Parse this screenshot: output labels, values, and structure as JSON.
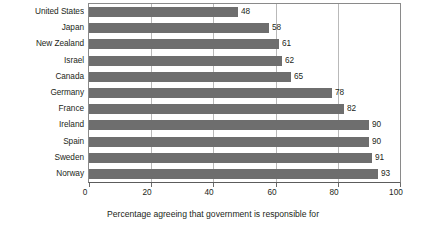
{
  "chart_data": {
    "type": "bar",
    "orientation": "horizontal",
    "title": "",
    "subtitle": "",
    "caption": "Percentage agreeing that government is responsible for",
    "xlabel": "",
    "ylabel": "",
    "xlim": [
      0,
      100
    ],
    "xticks": [
      "0",
      "20",
      "40",
      "60",
      "80",
      "100"
    ],
    "xtick_values": [
      0,
      20,
      40,
      60,
      80,
      100
    ],
    "grid": "vertical",
    "legend": "none",
    "bar_color": "#6e6e6e",
    "axis_color": "#8a8a8a",
    "grid_color": "#b9b9b9",
    "text_color": "#231f20",
    "categories": [
      "United States",
      "Japan",
      "New Zealand",
      "Israel",
      "Canada",
      "Germany",
      "France",
      "Ireland",
      "Spain",
      "Sweden",
      "Norway"
    ],
    "values": [
      48,
      58,
      61,
      62,
      65,
      78,
      82,
      90,
      90,
      91,
      93
    ],
    "value_labels": [
      "48",
      "58",
      "61",
      "62",
      "65",
      "78",
      "82",
      "90",
      "90",
      "91",
      "93"
    ],
    "rows": [
      {
        "label": "United States",
        "value": 48,
        "value_label": "48"
      },
      {
        "label": "Japan",
        "value": 58,
        "value_label": "58"
      },
      {
        "label": "New Zealand",
        "value": 61,
        "value_label": "61"
      },
      {
        "label": "Israel",
        "value": 62,
        "value_label": "62"
      },
      {
        "label": "Canada",
        "value": 65,
        "value_label": "65"
      },
      {
        "label": "Germany",
        "value": 78,
        "value_label": "78"
      },
      {
        "label": "France",
        "value": 82,
        "value_label": "82"
      },
      {
        "label": "Ireland",
        "value": 90,
        "value_label": "90"
      },
      {
        "label": "Spain",
        "value": 90,
        "value_label": "90"
      },
      {
        "label": "Sweden",
        "value": 91,
        "value_label": "91"
      },
      {
        "label": "Norway",
        "value": 93,
        "value_label": "93"
      }
    ]
  }
}
